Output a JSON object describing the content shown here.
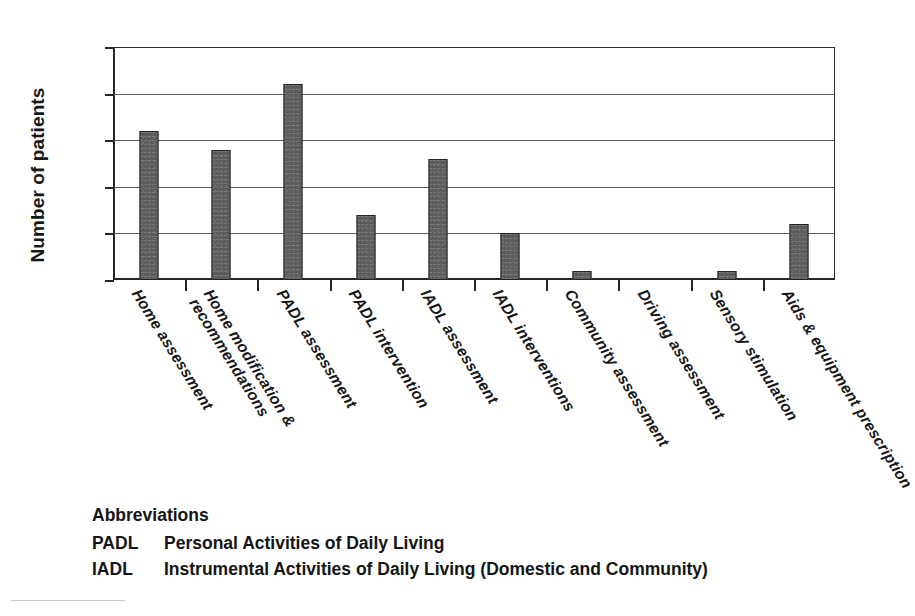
{
  "chart_data": {
    "type": "bar",
    "title": "",
    "xlabel": "",
    "ylabel": "Number of patients",
    "ylim": [
      0,
      25
    ],
    "ytick_values": [
      25,
      20,
      15,
      10,
      5,
      0
    ],
    "ytick_labels": [
      "25",
      "20",
      "15",
      "10",
      "5",
      "0"
    ],
    "grid": true,
    "legend_position": "none",
    "categories": [
      "Home assessment",
      "Home modification & recommendations",
      "PADL assessment",
      "PADL intervention",
      "IADL assessment",
      "IADL interventions",
      "Community assessment",
      "Driving assessment",
      "Sensory stimulation",
      "Aids & equipment prescription"
    ],
    "category_label_lines": [
      [
        "Home assessment"
      ],
      [
        "Home modification &",
        "recommendations"
      ],
      [
        "PADL assessment"
      ],
      [
        "PADL intervention"
      ],
      [
        "IADL assessment"
      ],
      [
        "IADL interventions"
      ],
      [
        "Community assessment"
      ],
      [
        "Driving assessment"
      ],
      [
        "Sensory stimulation"
      ],
      [
        "Aids & equipment prescription"
      ]
    ],
    "values": [
      16,
      14,
      21,
      7,
      13,
      5,
      1,
      0,
      1,
      6
    ],
    "bar_color": "#5e5e5e",
    "bar_edge_color": "#242424",
    "axis_color": "#262626",
    "gridline_color": "#5a5a5a",
    "background_color": "#ffffff"
  },
  "abbreviations": {
    "heading": "Abbreviations",
    "entries": [
      {
        "key": "PADL",
        "definition": "Personal Activities of Daily Living"
      },
      {
        "key": "IADL",
        "definition": "Instrumental Activities of Daily Living (Domestic and Community)"
      }
    ]
  }
}
